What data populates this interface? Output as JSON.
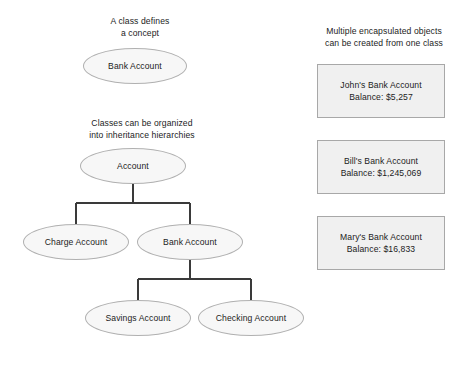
{
  "diagram": {
    "type": "class-and-object-diagram",
    "background_color": "#ffffff",
    "text_color": "#1c1c1c",
    "node_fill": "#f7f7f7",
    "node_border": "#b0b0b0",
    "box_fill": "#f0f0f0",
    "box_border": "#a8a8a8",
    "connector_color": "#3a3a3a"
  },
  "captions": {
    "class_concept": "A class defines\na concept",
    "inheritance": "Classes can be organized\ninto inheritance hierarchies",
    "objects": "Multiple encapsulated objects\ncan be created from one class"
  },
  "concept_node": {
    "label": "Bank Account"
  },
  "hierarchy": {
    "root": {
      "label": "Account"
    },
    "level2": [
      {
        "label": "Charge Account"
      },
      {
        "label": "Bank Account"
      }
    ],
    "level3": [
      {
        "label": "Savings Account"
      },
      {
        "label": "Checking Account"
      }
    ]
  },
  "objects": [
    {
      "title": "John's Bank Account",
      "balance": "Balance: $5,257"
    },
    {
      "title": "Bill's Bank Account",
      "balance": "Balance: $1,245,069"
    },
    {
      "title": "Mary's Bank Account",
      "balance": "Balance: $16,833"
    }
  ]
}
